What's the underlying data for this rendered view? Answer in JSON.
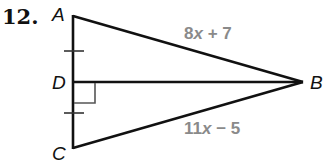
{
  "problem": {
    "number": "12."
  },
  "vertices": {
    "A": {
      "label": "A",
      "x": 73,
      "y": 16
    },
    "B": {
      "label": "B",
      "x": 303,
      "y": 82
    },
    "C": {
      "label": "C",
      "x": 73,
      "y": 148
    },
    "D": {
      "label": "D",
      "x": 73,
      "y": 82
    }
  },
  "sides": {
    "AB": {
      "coef": "8",
      "var": "x",
      "rest": " + 7",
      "full": "8x + 7"
    },
    "CB": {
      "coef": "11",
      "var": "x",
      "rest": " − 5",
      "full": "11x − 5"
    }
  },
  "markings": {
    "congruent_ticks": [
      "AD",
      "DC"
    ],
    "right_angle_at": "D"
  },
  "colors": {
    "line": "#111111",
    "expression": "#8a8a8a",
    "right_angle_mark": "#555555"
  }
}
